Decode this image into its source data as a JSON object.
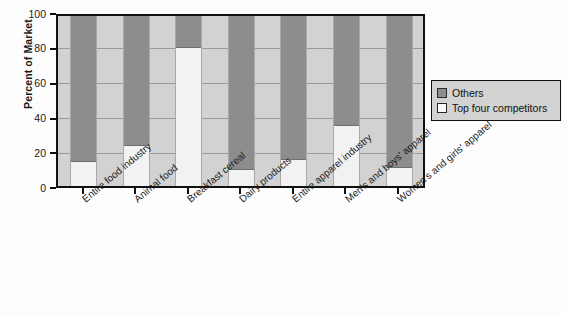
{
  "chart_data": {
    "type": "bar",
    "subtype": "stacked-vertical-100-percent",
    "title": "",
    "xlabel": "",
    "ylabel": "Percent of Market",
    "ylim": [
      0,
      100
    ],
    "yticks": [
      0,
      20,
      40,
      60,
      80,
      100
    ],
    "ytick_labels": [
      "0",
      "20",
      "40",
      "60",
      "80",
      "100"
    ],
    "grid": "horizontal",
    "legend_position": "right",
    "categories": [
      "Entire food industry",
      "Animal food",
      "Breakfast cereal",
      "Dairy products",
      "Entire apparel industry",
      "Men's and boys' apparel",
      "Women's and girls' apparel"
    ],
    "series": [
      {
        "name": "Top four competitors",
        "color": "#f2f2f2",
        "values": [
          15,
          24,
          82,
          10,
          16,
          36,
          11
        ]
      },
      {
        "name": "Others",
        "color": "#8d8d8d",
        "values": [
          85,
          76,
          18,
          90,
          84,
          64,
          89
        ]
      }
    ]
  },
  "axis": {
    "y_title": "Percent of Market",
    "y_tick_labels": [
      "100",
      "80",
      "60",
      "40",
      "20",
      "0"
    ]
  },
  "legend": {
    "items": [
      {
        "label": "Others",
        "swatch_color": "#8d8d8d"
      },
      {
        "label": "Top four competitors",
        "swatch_color": "#f7f7f7"
      }
    ]
  },
  "colors": {
    "others": "#8d8d8d",
    "top_four": "#f2f2f2",
    "plot_background": "#d2d2d2",
    "frame": "#111111",
    "gridline": "#9a9a9a"
  }
}
